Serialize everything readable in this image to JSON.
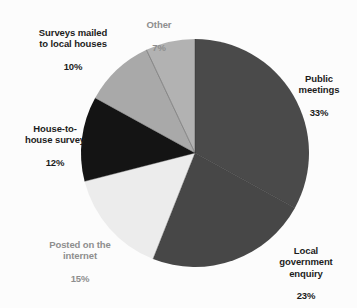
{
  "chart_data": {
    "type": "pie",
    "title": "",
    "subtitle": "",
    "xlabel": "",
    "ylabel": "",
    "legend_position": "none",
    "grid": false,
    "units": "percent",
    "total": 100,
    "categories": [
      "Public meetings",
      "Local government enquiry",
      "Posted on the internet",
      "House-to-house survey",
      "Surveys mailed to local houses",
      "Other"
    ],
    "values": [
      33,
      23,
      15,
      12,
      10,
      7
    ],
    "slices": [
      {
        "id": "public-meetings",
        "name": "Public meetings",
        "label_lines": "Public\nmeetings",
        "value": 33,
        "value_text": "33%",
        "color": "#4a4a4a",
        "start_angle": 0,
        "end_angle": 118.8,
        "label_style": "strong"
      },
      {
        "id": "local-government-enquiry",
        "name": "Local government enquiry",
        "label_lines": "Local\ngovernment\nenquiry",
        "value": 23,
        "value_text": "23%",
        "color": "#474747",
        "start_angle": 118.8,
        "end_angle": 201.6,
        "label_style": "strong"
      },
      {
        "id": "posted-on-the-internet",
        "name": "Posted on the internet",
        "label_lines": "Posted on the\ninternet",
        "value": 15,
        "value_text": "15%",
        "color": "#ececec",
        "start_angle": 201.6,
        "end_angle": 255.6,
        "label_style": "muted"
      },
      {
        "id": "house-to-house-survey",
        "name": "House-to-house survey",
        "label_lines": "House-to-\nhouse survey",
        "value": 12,
        "value_text": "12%",
        "color": "#141414",
        "start_angle": 255.6,
        "end_angle": 298.8,
        "label_style": "strong"
      },
      {
        "id": "surveys-mailed-to-local-houses",
        "name": "Surveys mailed to local houses",
        "label_lines": "Surveys mailed\nto local houses",
        "value": 10,
        "value_text": "10%",
        "color": "#a9a9a9",
        "start_angle": 298.8,
        "end_angle": 334.8,
        "label_style": "strong"
      },
      {
        "id": "other",
        "name": "Other",
        "label_lines": "Other",
        "value": 7,
        "value_text": "7%",
        "color": "#b2b2b2",
        "start_angle": 334.8,
        "end_angle": 360,
        "label_style": "muted"
      }
    ],
    "geometry": {
      "center_x": 114,
      "center_y": 114,
      "radius": 114,
      "start_at_twelve_oclock": true,
      "direction": "clockwise"
    },
    "colors": {
      "background": "#fcfcfc",
      "divider": "#2a2a2a",
      "label_strong": "#1c1c1c",
      "label_muted": "#8e8e8e"
    }
  }
}
